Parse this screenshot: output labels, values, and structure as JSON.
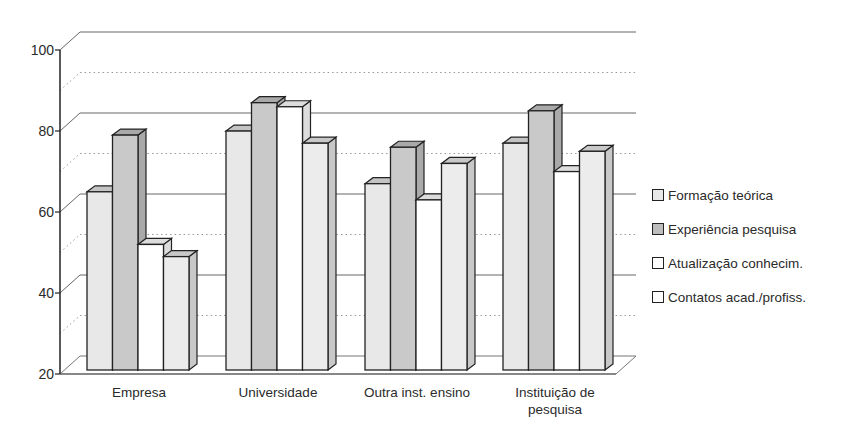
{
  "chart_data": {
    "type": "bar",
    "style": "3d-clustered-column",
    "title": "",
    "xlabel": "",
    "ylabel": "",
    "ylim": [
      20,
      100
    ],
    "yticks": [
      20,
      40,
      60,
      80,
      100
    ],
    "grid": {
      "major": "solid",
      "minor": "dotted",
      "minor_step": 10
    },
    "legend_position": "right",
    "categories": [
      "Empresa",
      "Universidade",
      "Outra inst. ensino",
      "Instituição de pesquisa"
    ],
    "category_label_lines": [
      [
        "Empresa"
      ],
      [
        "Universidade"
      ],
      [
        "Outra inst. ensino"
      ],
      [
        "Instituição de",
        "pesquisa"
      ]
    ],
    "series": [
      {
        "name": "Formação teórica",
        "values": [
          64,
          79,
          66,
          76
        ],
        "color": "#e8e8e8",
        "side": "#c4c4c4"
      },
      {
        "name": "Experiência pesquisa",
        "values": [
          78,
          86,
          75,
          84
        ],
        "color": "#c9c9c9",
        "side": "#a9a9a9"
      },
      {
        "name": "Atualização conhecim.",
        "values": [
          51,
          85,
          62,
          69
        ],
        "color": "#ffffff",
        "side": "#dcdcdc"
      },
      {
        "name": "Contatos acad./profiss.",
        "values": [
          48,
          76,
          71,
          74
        ],
        "color": "#ececec",
        "side": "#c8c8c8"
      }
    ]
  },
  "legend": {
    "items": [
      {
        "label": "Formação teórica",
        "color": "#e8e8e8"
      },
      {
        "label": "Experiência pesquisa",
        "color": "#bdbdbd"
      },
      {
        "label": "Atualização conhecim.",
        "color": "#ffffff"
      },
      {
        "label": "Contatos acad./profiss.",
        "color": "#ffffff"
      }
    ]
  }
}
